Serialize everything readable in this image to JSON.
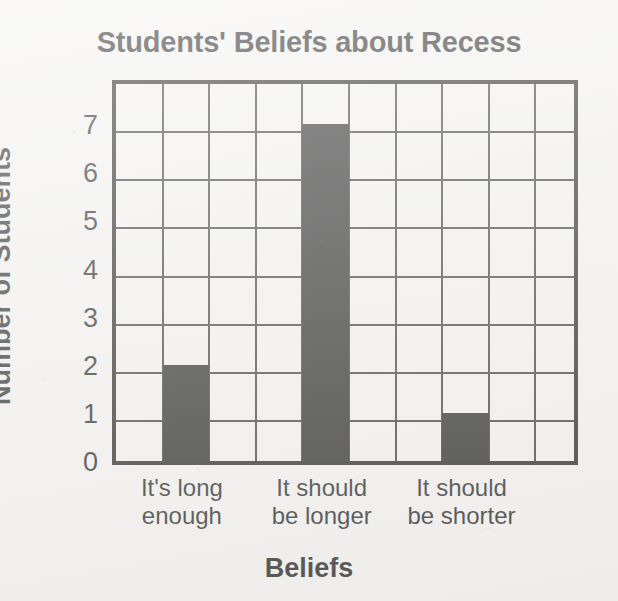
{
  "chart_data": {
    "type": "bar",
    "title": "Students' Beliefs about Recess",
    "xlabel": "Beliefs",
    "ylabel": "Number of Students",
    "categories": [
      "It's long\nenough",
      "It should\nbe longer",
      "It should\nbe shorter"
    ],
    "category_lines": [
      [
        "It's long",
        "enough"
      ],
      [
        "It should",
        "be longer"
      ],
      [
        "It should",
        "be shorter"
      ]
    ],
    "values": [
      2,
      7,
      1
    ],
    "ylim": [
      0,
      8
    ],
    "y_ticks": [
      0,
      1,
      2,
      3,
      4,
      5,
      6,
      7
    ],
    "y_tick_labels": [
      "0",
      "1",
      "2",
      "3",
      "4",
      "5",
      "6",
      "7"
    ],
    "grid": true,
    "grid_columns": 10,
    "grid_rows": 8,
    "bar_grid_columns": [
      2,
      5,
      8
    ],
    "legend": null,
    "colors": {
      "bar": "#141414",
      "grid": "#2a2a2a",
      "frame": "#111111",
      "background": "#f2f1ef",
      "text": "#111111"
    }
  }
}
